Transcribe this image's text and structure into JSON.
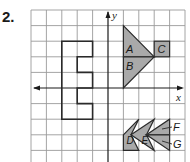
{
  "problem": {
    "number": "2."
  },
  "axes": {
    "x_label": "x",
    "y_label": "y"
  },
  "grid": {
    "columns": 10,
    "rows": 10,
    "origin_col": 5,
    "origin_row": 5
  },
  "colors": {
    "shape_fill": "#a9a9a9",
    "stroke": "#2a2a2a",
    "grid": "#9a9a9a"
  },
  "shapes": {
    "outline_figure": {
      "name": "E-shaped polygon",
      "filled": false
    },
    "labels": {
      "A": "A",
      "B": "B",
      "C": "C",
      "D": "D",
      "E": "E",
      "F": "F",
      "G": "G"
    }
  }
}
